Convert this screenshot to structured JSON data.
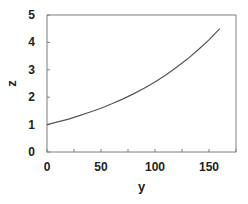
{
  "chart_data": {
    "type": "line",
    "title": "",
    "xlabel": "y",
    "ylabel": "z",
    "xlim": [
      0,
      175
    ],
    "ylim": [
      0,
      5
    ],
    "xticks": [
      0,
      50,
      100,
      150
    ],
    "yticks": [
      0,
      1,
      2,
      3,
      4,
      5
    ],
    "grid": false,
    "legend": null,
    "series": [
      {
        "name": "z(y)",
        "color": "#555555",
        "x": [
          0,
          10,
          20,
          30,
          40,
          50,
          60,
          70,
          80,
          90,
          100,
          110,
          120,
          130,
          140,
          150,
          160
        ],
        "y": [
          1.0,
          1.1,
          1.2,
          1.33,
          1.46,
          1.6,
          1.76,
          1.93,
          2.12,
          2.33,
          2.56,
          2.81,
          3.09,
          3.39,
          3.73,
          4.09,
          4.5
        ]
      }
    ]
  },
  "plot": {
    "frame_color": "#7f7f7f",
    "left": 47,
    "top": 15,
    "right": 236,
    "bottom": 152
  }
}
